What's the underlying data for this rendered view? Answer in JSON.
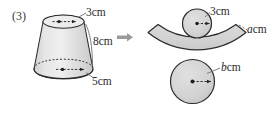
{
  "problem": {
    "number": "(3)"
  },
  "solid": {
    "name": "truncated-cone",
    "labels": {
      "top_radius": "3cm",
      "slant_height": "8cm",
      "bottom_radius": "5cm"
    }
  },
  "transition": {
    "icon": "right-arrow-icon"
  },
  "net": {
    "name": "cone-net",
    "labels": {
      "small_circle_radius": "3cm",
      "sector_label_value": "a",
      "sector_label_unit": "cm",
      "large_circle_radius_value": "b",
      "large_circle_radius_unit": "cm"
    }
  },
  "style": {
    "fill": "#d4d4d4",
    "stroke": "#2b2b2b",
    "arrow": "#9a9a9a",
    "leader": "#6e6e6e"
  }
}
